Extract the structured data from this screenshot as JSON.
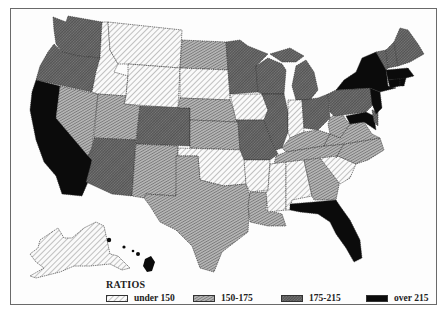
{
  "map": {
    "type": "choropleth",
    "region": "United States",
    "legend_title": "RATIOS",
    "classes": [
      {
        "id": "c1",
        "label": "under 150",
        "pattern": "light-diagonal-hatch",
        "color": "#e6e6e6"
      },
      {
        "id": "c2",
        "label": "150-175",
        "pattern": "medium-diagonal-hatch",
        "color": "#9a9a9a"
      },
      {
        "id": "c3",
        "label": "175-215",
        "pattern": "dense-crosshatch",
        "color": "#5c5c5c"
      },
      {
        "id": "c4",
        "label": "over 215",
        "pattern": "solid-black",
        "color": "#0a0a0a"
      }
    ],
    "states": {
      "WA": "175-215",
      "OR": "175-215",
      "CA": "over 215",
      "NV": "150-175",
      "ID": "under 150",
      "MT": "under 150",
      "WY": "under 150",
      "UT": "150-175",
      "AZ": "175-215",
      "CO": "175-215",
      "NM": "150-175",
      "ND": "150-175",
      "SD": "under 150",
      "NE": "150-175",
      "KS": "150-175",
      "OK": "under 150",
      "TX": "150-175",
      "MN": "175-215",
      "IA": "under 150",
      "MO": "175-215",
      "AR": "under 150",
      "LA": "150-175",
      "WI": "175-215",
      "IL": "175-215",
      "MI": "175-215",
      "IN": "under 150",
      "OH": "175-215",
      "KY": "150-175",
      "TN": "150-175",
      "MS": "under 150",
      "AL": "under 150",
      "GA": "150-175",
      "FL": "over 215",
      "SC": "under 150",
      "NC": "150-175",
      "VA": "150-175",
      "WV": "150-175",
      "PA": "175-215",
      "NY": "over 215",
      "NJ": "over 215",
      "MD": "over 215",
      "DE": "175-215",
      "CT": "over 215",
      "RI": "over 215",
      "MA": "over 215",
      "VT": "175-215",
      "NH": "175-215",
      "ME": "175-215",
      "AK": "under 150",
      "HI": "over 215"
    }
  }
}
